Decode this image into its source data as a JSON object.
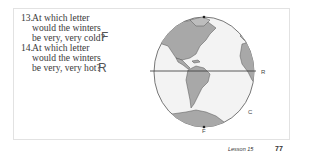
{
  "questions": [
    {
      "number": "13.",
      "lines": [
        "At which letter",
        "would the winters",
        "be very, very cold?"
      ],
      "answer": "F"
    },
    {
      "number": "14.",
      "lines": [
        "At which letter",
        "would the winters",
        "be very, very hot?"
      ],
      "answer": "R"
    }
  ],
  "globe": {
    "labels": {
      "r": "R",
      "c": "C",
      "f": "F"
    },
    "land_color": "#a9a9a9",
    "ocean_color": "#f2f2f2"
  },
  "footer": {
    "lesson": "Lesson 15",
    "page_number": "77"
  }
}
